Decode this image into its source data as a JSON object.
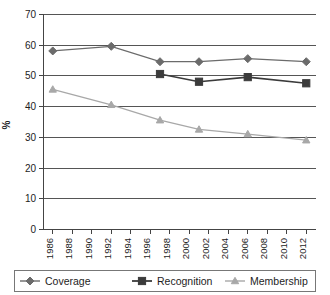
{
  "chart_data": {
    "type": "line",
    "title": "",
    "subtitle": "",
    "xlabel": "",
    "ylabel": "%",
    "ylim": [
      0,
      70
    ],
    "xlim": [
      1985,
      2013
    ],
    "ytick_step": 10,
    "yticks": [
      "0",
      "10",
      "20",
      "30",
      "40",
      "50",
      "60",
      "70"
    ],
    "xticks": [
      "1986",
      "1988",
      "1990",
      "1992",
      "1994",
      "1996",
      "1998",
      "2000",
      "2002",
      "2004",
      "2006",
      "2008",
      "2010",
      "2012"
    ],
    "grid": true,
    "grid_axis": "y",
    "legend_position": "bottom",
    "x": [
      1986,
      1992,
      1997,
      2001,
      2006,
      2012
    ],
    "series": [
      {
        "name": "Coverage",
        "marker": "diamond",
        "color": "#6b6b6b",
        "values": [
          58.0,
          59.5,
          54.5,
          54.5,
          55.5,
          54.5
        ]
      },
      {
        "name": "Recognition",
        "marker": "square",
        "color": "#3b3b3b",
        "values": [
          null,
          null,
          50.5,
          48.0,
          49.5,
          47.5
        ]
      },
      {
        "name": "Membership",
        "marker": "triangle",
        "color": "#a8a8a8",
        "values": [
          45.5,
          40.5,
          35.5,
          32.5,
          31.0,
          29.0
        ]
      }
    ]
  },
  "axis": {
    "y_title": "%",
    "y_tick_labels": [
      "70",
      "60",
      "50",
      "40",
      "30",
      "20",
      "10",
      "0"
    ],
    "x_tick_labels": [
      "1986",
      "1988",
      "1990",
      "1992",
      "1994",
      "1996",
      "1998",
      "2000",
      "2002",
      "2004",
      "2006",
      "2008",
      "2010",
      "2012"
    ]
  },
  "legend": {
    "items": [
      {
        "label": "Coverage",
        "marker": "diamond-marker",
        "color": "#6b6b6b"
      },
      {
        "label": "Recognition",
        "marker": "square-marker",
        "color": "#3b3b3b"
      },
      {
        "label": "Membership",
        "marker": "triangle-marker",
        "color": "#a8a8a8"
      }
    ]
  },
  "colors": {
    "coverage": "#6b6b6b",
    "recognition": "#3b3b3b",
    "membership": "#a8a8a8",
    "gridline": "#555555",
    "axis": "#444444",
    "text": "#1d1d1d",
    "background": "#ffffff"
  }
}
